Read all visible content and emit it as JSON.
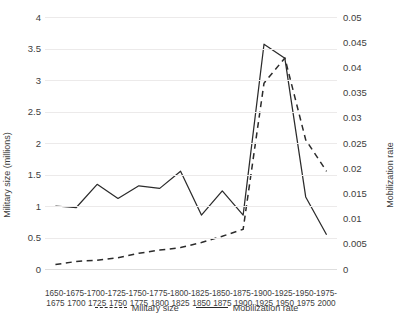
{
  "chart_data": {
    "type": "line",
    "title": "",
    "xlabel": "",
    "categories": [
      "1650-\n1675",
      "1675-\n1700",
      "1700-\n1725",
      "1725-\n1750",
      "1750-\n1775",
      "1775-\n1800",
      "1800-\n1825",
      "1825-\n1850",
      "1850-\n1875",
      "1875-\n1900",
      "1900-\n1925",
      "1925-\n1950",
      "1950-\n1975",
      "1975-\n2000"
    ],
    "categories_line1": [
      "1650-",
      "1675-",
      "1700-",
      "1725-",
      "1750-",
      "1775-",
      "1800-",
      "1825-",
      "1850-",
      "1875-",
      "1900-",
      "1925-",
      "1950-",
      "1975-"
    ],
    "categories_line2": [
      "1675",
      "1700",
      "1725",
      "1750",
      "1775",
      "1800",
      "1825",
      "1850",
      "1875",
      "1900",
      "1925",
      "1950",
      "1975",
      "2000"
    ],
    "left_axis": {
      "label": "Military size (millions)",
      "ylim": [
        0,
        4
      ],
      "ticks": [
        "0",
        "0.5",
        "1",
        "1.5",
        "2",
        "2.5",
        "3",
        "3.5",
        "4"
      ],
      "tick_values": [
        0,
        0.5,
        1,
        1.5,
        2,
        2.5,
        3,
        3.5,
        4
      ]
    },
    "right_axis": {
      "label": "Mobilization rate",
      "ylim": [
        0,
        0.05
      ],
      "ticks": [
        "0",
        "0.005",
        "0.01",
        "0.015",
        "0.02",
        "0.025",
        "0.03",
        "0.035",
        "0.04",
        "0.045",
        "0.05"
      ],
      "tick_values": [
        0,
        0.005,
        0.01,
        0.015,
        0.02,
        0.025,
        0.03,
        0.035,
        0.04,
        0.045,
        0.05
      ]
    },
    "grid": true,
    "legend_position": "bottom",
    "series": [
      {
        "name": "Military size",
        "axis": "left",
        "style": "dashed",
        "color": "#2b2b2b",
        "values": [
          0.07,
          0.12,
          0.14,
          0.18,
          0.25,
          0.3,
          0.34,
          0.42,
          0.52,
          0.63,
          2.95,
          3.35,
          2.05,
          1.55
        ]
      },
      {
        "name": "Mobilization rate",
        "axis": "right",
        "style": "solid",
        "color": "#2b2b2b",
        "values": [
          0.0125,
          0.0122,
          0.0168,
          0.014,
          0.0165,
          0.016,
          0.0194,
          0.0107,
          0.0155,
          0.0107,
          0.0446,
          0.0418,
          0.0143,
          0.0068
        ]
      }
    ]
  },
  "legend": {
    "items": [
      {
        "label": "Military size",
        "style": "dashed"
      },
      {
        "label": "Mobilization rate",
        "style": "solid"
      }
    ]
  }
}
